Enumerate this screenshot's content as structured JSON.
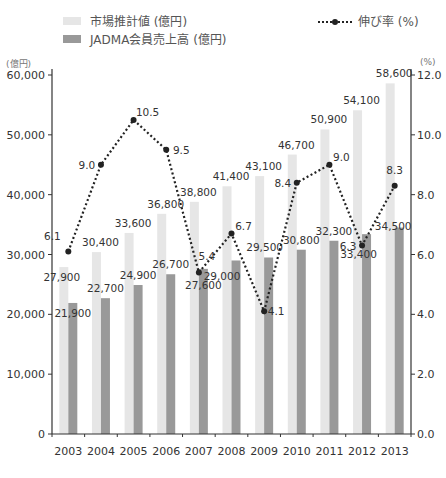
{
  "legend": {
    "market_label": "市場推計値 (億円)",
    "jadma_label": "JADMA会員売上高 (億円)",
    "growth_label": "伸び率 (%)"
  },
  "axes": {
    "left_unit": "(億円)",
    "right_unit": "(%)"
  },
  "colors": {
    "market": "#e6e6e6",
    "jadma": "#999999",
    "line": "#222222",
    "axis": "#333333",
    "text": "#333333"
  },
  "chart_data": {
    "type": "bar",
    "title": "",
    "xlabel": "",
    "ylabel": "(億円)",
    "y2label": "(%)",
    "categories": [
      "2003",
      "2004",
      "2005",
      "2006",
      "2007",
      "2008",
      "2009",
      "2010",
      "2011",
      "2012",
      "2013"
    ],
    "series": [
      {
        "name": "市場推計値 (億円)",
        "type": "bar",
        "axis": "left",
        "values": [
          27900,
          30400,
          33600,
          36800,
          38800,
          41400,
          43100,
          46700,
          50900,
          54100,
          58600
        ]
      },
      {
        "name": "JADMA会員売上高 (億円)",
        "type": "bar",
        "axis": "left",
        "values": [
          21900,
          22700,
          24900,
          26700,
          27600,
          29000,
          29500,
          30800,
          32300,
          33400,
          34500
        ]
      },
      {
        "name": "伸び率 (%)",
        "type": "line",
        "axis": "right",
        "values": [
          6.1,
          9.0,
          10.5,
          9.5,
          5.4,
          6.7,
          4.1,
          8.4,
          9.0,
          6.3,
          8.3
        ]
      }
    ],
    "ylim": [
      0,
      60000
    ],
    "yticks": [
      0,
      10000,
      20000,
      30000,
      40000,
      50000,
      60000
    ],
    "ytick_labels": [
      "0",
      "10,000",
      "20,000",
      "30,000",
      "40,000",
      "50,000",
      "60,000"
    ],
    "y2lim": [
      0,
      12
    ],
    "y2ticks": [
      0,
      2,
      4,
      6,
      8,
      10,
      12
    ],
    "y2tick_labels": [
      "0.0",
      "2.0",
      "4.0",
      "6.0",
      "8.0",
      "10.0",
      "12.0"
    ],
    "grid": false,
    "legend_position": "top"
  }
}
